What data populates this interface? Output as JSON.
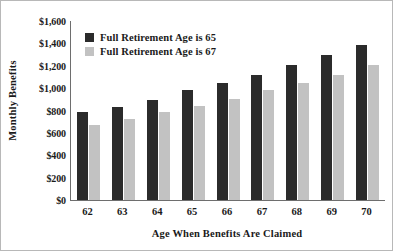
{
  "chart_data": {
    "type": "bar",
    "title": "",
    "xlabel": "Age When Benefits Are Claimed",
    "ylabel": "Monthly Benefits",
    "categories": [
      "62",
      "63",
      "64",
      "65",
      "66",
      "67",
      "68",
      "69",
      "70"
    ],
    "series": [
      {
        "name": "Full Retirement Age is 65",
        "color": "#2b2b2b",
        "values": [
          785,
          835,
          890,
          985,
          1045,
          1120,
          1210,
          1300,
          1390
        ]
      },
      {
        "name": "Full Retirement Age is 67",
        "color": "#c2c2c2",
        "values": [
          670,
          725,
          785,
          840,
          900,
          985,
          1045,
          1120,
          1210
        ]
      }
    ],
    "ylim": [
      0,
      1600
    ],
    "ytick_values": [
      0,
      200,
      400,
      600,
      800,
      1000,
      1200,
      1400,
      1600
    ],
    "ytick_labels": [
      "$0",
      "$200",
      "$400",
      "$600",
      "$800",
      "$1,000",
      "$1,200",
      "$1,400",
      "$1,600"
    ],
    "grid": false,
    "legend_position": "upper-left-inside"
  }
}
